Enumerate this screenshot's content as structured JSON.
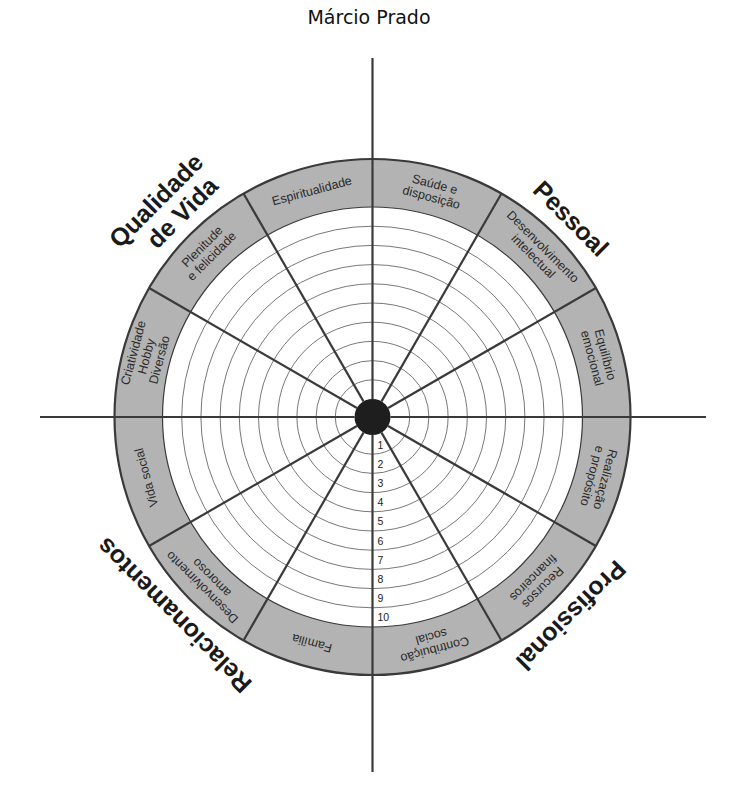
{
  "title": "Márcio Prado",
  "colors": {
    "band": "#b3b3b3",
    "lines": "#3a3a3a",
    "rings": "#555555",
    "hub": "#1e1e1e",
    "inner_fill": "#ffffff"
  },
  "wheel": {
    "sector_count": 12,
    "ring_count": 10,
    "ring_numbers": [
      "1",
      "2",
      "3",
      "4",
      "5",
      "6",
      "7",
      "8",
      "9",
      "10"
    ],
    "areas": [
      {
        "lines": [
          "Saúde e",
          "disposição"
        ]
      },
      {
        "lines": [
          "Desenvolvimento",
          "intelectual"
        ]
      },
      {
        "lines": [
          "Equilíbrio",
          "emocional"
        ]
      },
      {
        "lines": [
          "Realização",
          "e propósito"
        ]
      },
      {
        "lines": [
          "Recursos",
          "financeiros"
        ]
      },
      {
        "lines": [
          "Contribuição",
          "social"
        ]
      },
      {
        "lines": [
          "Família"
        ]
      },
      {
        "lines": [
          "Desenvolvimento",
          "amoroso"
        ]
      },
      {
        "lines": [
          "Vida social"
        ]
      },
      {
        "lines": [
          "Criatividade",
          "Hobby",
          "Diversão"
        ]
      },
      {
        "lines": [
          "Plenitude",
          "e felicidade"
        ]
      },
      {
        "lines": [
          "Espiritualidade"
        ]
      }
    ],
    "groups": [
      {
        "name": "Pessoal",
        "lines": [
          "Pessoal"
        ]
      },
      {
        "name": "Profissional",
        "lines": [
          "Profissional"
        ]
      },
      {
        "name": "Relacionamentos",
        "lines": [
          "Relacionamentos"
        ]
      },
      {
        "name": "Qualidade de Vida",
        "lines": [
          "Qualidade",
          "de Vida"
        ]
      }
    ]
  }
}
